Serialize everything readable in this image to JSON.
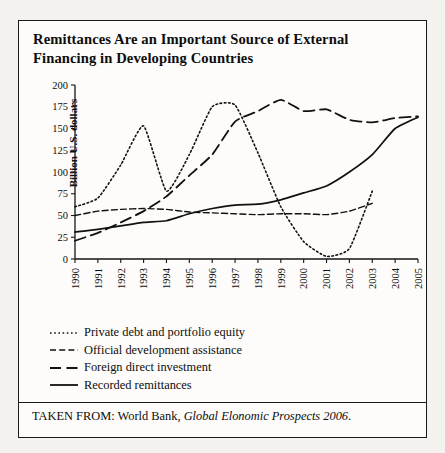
{
  "title": "Remittances Are an Important Source of External Financing in Developing Countries",
  "source": {
    "prefix": "TAKEN FROM: World Bank, ",
    "italic": "Global Elonomic Prospects 2006",
    "suffix": "."
  },
  "legend": [
    {
      "label": "Private debt and portfolio equity",
      "style": "dotted"
    },
    {
      "label": "Official development assistance",
      "style": "shortdash"
    },
    {
      "label": "Foreign direct investment",
      "style": "longdash"
    },
    {
      "label": "Recorded remittances",
      "style": "solid"
    }
  ],
  "chart_data": {
    "type": "line",
    "title": "Remittances Are an Important Source of External Financing in Developing Countries",
    "xlabel": "",
    "ylabel": "Billion U.S. dollars",
    "x": [
      1990,
      1991,
      1992,
      1993,
      1994,
      1995,
      1996,
      1997,
      1998,
      1999,
      2000,
      2001,
      2002,
      2003,
      2004,
      2005
    ],
    "xticklabels": [
      "1990",
      "1991",
      "1992",
      "1993",
      "1994",
      "1995",
      "1996",
      "1997",
      "1998",
      "1999",
      "2000",
      "2001",
      "2002",
      "2003",
      "2004",
      "2005"
    ],
    "yticks": [
      0,
      25,
      50,
      75,
      100,
      125,
      150,
      175,
      200
    ],
    "yticklabels": [
      "0",
      "25",
      "50",
      "75",
      "100",
      "125",
      "150",
      "175",
      "200"
    ],
    "ylim": [
      0,
      200
    ],
    "xlim": [
      1990,
      2005
    ],
    "grid": false,
    "legend_position": "below-plot",
    "series": [
      {
        "name": "Private debt and portfolio equity",
        "style": "dotted",
        "values": [
          60,
          70,
          108,
          153,
          78,
          120,
          175,
          177,
          122,
          60,
          20,
          3,
          12,
          78,
          null,
          null
        ]
      },
      {
        "name": "Official development assistance",
        "style": "shortdash",
        "values": [
          50,
          55,
          57,
          58,
          57,
          54,
          53,
          52,
          51,
          52,
          52,
          51,
          55,
          64,
          null,
          null
        ]
      },
      {
        "name": "Foreign direct investment",
        "style": "longdash",
        "values": [
          21,
          30,
          42,
          55,
          72,
          96,
          120,
          158,
          170,
          183,
          170,
          172,
          160,
          157,
          162,
          164
        ]
      },
      {
        "name": "Recorded remittances",
        "style": "solid",
        "values": [
          31,
          34,
          38,
          42,
          44,
          52,
          58,
          62,
          63,
          68,
          76,
          84,
          100,
          120,
          150,
          163
        ]
      }
    ]
  },
  "axis": {
    "y_title": "Billion U.S. dollars"
  }
}
